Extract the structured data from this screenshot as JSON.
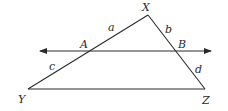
{
  "diagram": {
    "type": "triangle-with-parallel-transversal",
    "vertices": {
      "X": {
        "label": "X",
        "x": 148,
        "y": 15
      },
      "Y": {
        "label": "Y",
        "x": 28,
        "y": 89
      },
      "Z": {
        "label": "Z",
        "x": 205,
        "y": 89
      }
    },
    "intersections": {
      "A": {
        "label": "A",
        "x": 88,
        "y": 51
      },
      "B": {
        "label": "B",
        "x": 175,
        "y": 51
      }
    },
    "line": {
      "x1": 38,
      "y1": 51,
      "x2": 211,
      "y2": 51,
      "arrows": "both"
    },
    "segment_labels": {
      "a": "a",
      "b": "b",
      "c": "c",
      "d": "d"
    },
    "colors": {
      "stroke": "#2a2a2a",
      "background": "#ffffff"
    }
  }
}
